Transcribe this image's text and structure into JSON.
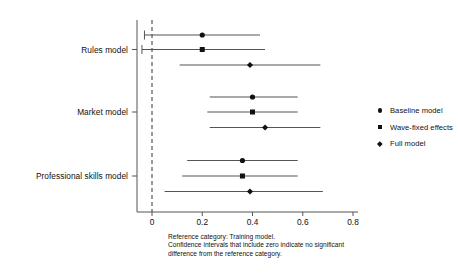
{
  "chart_data": {
    "type": "scatter",
    "subtype": "forest-plot",
    "title": "",
    "xlabel": "",
    "ylabel": "",
    "xlim": [
      -0.06,
      0.84
    ],
    "xticks": [
      0,
      0.2,
      0.4,
      0.6,
      0.8
    ],
    "xtick_labels": [
      "0",
      "0.2",
      "0.4",
      "0.6",
      "0.8"
    ],
    "grid": false,
    "reference_line": 0,
    "reference_line_style": "dashed",
    "legend_position": "right",
    "categories": [
      "Rules model",
      "Market model",
      "Professional skills model"
    ],
    "series": [
      {
        "name": "Baseline model",
        "marker": "circle",
        "values": [
          0.2,
          0.4,
          0.36
        ],
        "ci_low": [
          -0.03,
          0.23,
          0.14
        ],
        "ci_high": [
          0.43,
          0.58,
          0.58
        ]
      },
      {
        "name": "Wave-fixed effects",
        "marker": "square",
        "values": [
          0.2,
          0.4,
          0.36
        ],
        "ci_low": [
          -0.04,
          0.22,
          0.12
        ],
        "ci_high": [
          0.45,
          0.58,
          0.58
        ]
      },
      {
        "name": "Full model",
        "marker": "diamond",
        "values": [
          0.39,
          0.45,
          0.39
        ],
        "ci_low": [
          0.11,
          0.23,
          0.05
        ],
        "ci_high": [
          0.67,
          0.67,
          0.68
        ]
      }
    ],
    "points": [
      {
        "group": "Rules model",
        "series": "Baseline model",
        "marker": "circle",
        "estimate": 0.2,
        "ci_low": -0.03,
        "ci_high": 0.43,
        "row": 0
      },
      {
        "group": "Rules model",
        "series": "Wave-fixed effects",
        "marker": "square",
        "estimate": 0.2,
        "ci_low": -0.04,
        "ci_high": 0.45,
        "row": 1
      },
      {
        "group": "Rules model",
        "series": "Full model",
        "marker": "diamond",
        "estimate": 0.39,
        "ci_low": 0.11,
        "ci_high": 0.67,
        "row": 2
      },
      {
        "group": "Market model",
        "series": "Baseline model",
        "marker": "circle",
        "estimate": 0.4,
        "ci_low": 0.23,
        "ci_high": 0.58,
        "row": 3
      },
      {
        "group": "Market model",
        "series": "Wave-fixed effects",
        "marker": "square",
        "estimate": 0.4,
        "ci_low": 0.22,
        "ci_high": 0.58,
        "row": 4
      },
      {
        "group": "Market model",
        "series": "Full model",
        "marker": "diamond",
        "estimate": 0.45,
        "ci_low": 0.23,
        "ci_high": 0.67,
        "row": 5
      },
      {
        "group": "Professional skills model",
        "series": "Baseline model",
        "marker": "circle",
        "estimate": 0.36,
        "ci_low": 0.14,
        "ci_high": 0.58,
        "row": 6
      },
      {
        "group": "Professional skills model",
        "series": "Wave-fixed effects",
        "marker": "square",
        "estimate": 0.36,
        "ci_low": 0.12,
        "ci_high": 0.58,
        "row": 7
      },
      {
        "group": "Professional skills model",
        "series": "Full model",
        "marker": "diamond",
        "estimate": 0.39,
        "ci_low": 0.05,
        "ci_high": 0.68,
        "row": 8
      }
    ]
  },
  "legend": {
    "items": [
      {
        "label": "Baseline model",
        "marker": "circle"
      },
      {
        "label": "Wave-fixed effects",
        "marker": "square"
      },
      {
        "label": "Full model",
        "marker": "diamond"
      }
    ]
  },
  "axis": {
    "ytick_labels": [
      "Rules model",
      "Market model",
      "Professional skills model"
    ],
    "xtick_labels": [
      "0",
      "0.2",
      "0.4",
      "0.6",
      "0.8"
    ]
  },
  "footnote": {
    "text": "Reference category: Training model.\nConfidence intervals that include zero indicate no significant\ndifference from the reference category."
  },
  "colors": {
    "marker": "#111111",
    "line": "#555555",
    "axis": "#555555",
    "reference": "#333333",
    "text": "#101010"
  }
}
